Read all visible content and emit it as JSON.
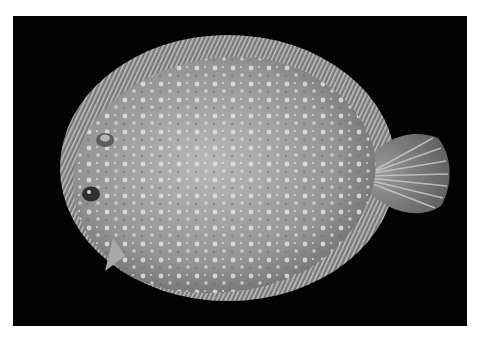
{
  "image": {
    "subject": "flatfish",
    "description": "Photograph of a spotted flatfish (flounder) viewed from above, with fringed dorsal and anal fins and a fan-shaped tail fin, on a black background",
    "colors": {
      "page_background": "#ffffff",
      "photo_background": "#030303",
      "body": "#9a9a9a",
      "body_light": "#c9c9c9",
      "spots": "#e6e6e6",
      "fin_rays": "#bdbdbd"
    }
  }
}
